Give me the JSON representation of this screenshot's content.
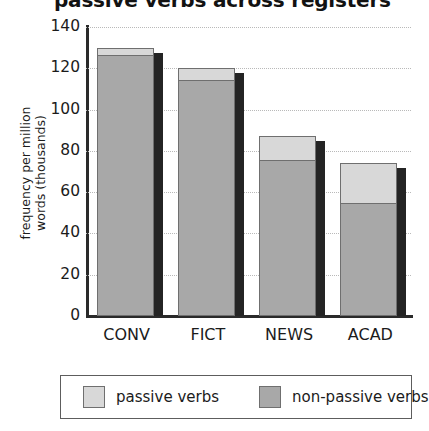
{
  "chart_data": {
    "type": "bar",
    "subtype": "stacked-bar",
    "title": "passive verbs across registers",
    "xlabel": "",
    "ylabel": "frequency per million words (thousands)",
    "ylabel_line1": "frequency per million",
    "ylabel_line2": "words (thousands)",
    "categories": [
      "CONV",
      "FICT",
      "NEWS",
      "ACAD"
    ],
    "series": [
      {
        "name": "non-passive verbs",
        "color": "#a8a8a8",
        "values": [
          127,
          115,
          76,
          55
        ]
      },
      {
        "name": "passive verbs",
        "color": "#d8d8d8",
        "values": [
          3,
          5,
          11,
          19
        ]
      }
    ],
    "totals": [
      130,
      120,
      87,
      74
    ],
    "ylim": [
      0,
      140
    ],
    "ytick_labels": [
      "140",
      "120",
      "100",
      "80",
      "60",
      "40",
      "20",
      "0"
    ],
    "ytick_values": [
      140,
      120,
      100,
      80,
      60,
      40,
      20,
      0
    ],
    "grid": true,
    "grid_style": "dotted-horizontal",
    "legend_position": "bottom",
    "legend_entries": [
      {
        "label": "passive verbs",
        "color": "#d8d8d8"
      },
      {
        "label": "non-passive verbs",
        "color": "#a8a8a8"
      }
    ]
  }
}
